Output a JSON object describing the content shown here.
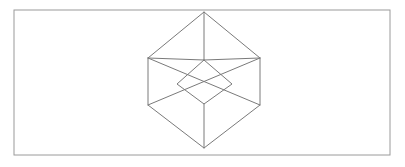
{
  "page": {
    "background_color": "#ffffff",
    "width": 405,
    "height": 167
  },
  "frame": {
    "name": "figure-border",
    "x": 14,
    "y": 10,
    "width": 376,
    "height": 145,
    "stroke_color": "#9a9a9a",
    "stroke_width": 1,
    "fill_color": "#ffffff"
  },
  "figure": {
    "kind": "wireframe-cube",
    "stroke_color": "#7a7a7a",
    "stroke_width": 1,
    "center_x": 204,
    "center_y": 80,
    "outline_points": "204,12 260,58 260,105 204,148 148,105 148,58",
    "outline_vertices": [
      {
        "name": "top",
        "x": 204,
        "y": 12
      },
      {
        "name": "upper-right",
        "x": 260,
        "y": 58
      },
      {
        "name": "lower-right",
        "x": 260,
        "y": 105
      },
      {
        "name": "bottom",
        "x": 204,
        "y": 148
      },
      {
        "name": "lower-left",
        "x": 148,
        "y": 105
      },
      {
        "name": "upper-left",
        "x": 148,
        "y": 58
      }
    ],
    "inner_vertices": [
      {
        "name": "inner-top",
        "x": 204,
        "y": 60
      },
      {
        "name": "inner-right",
        "x": 232,
        "y": 84
      },
      {
        "name": "inner-bottom",
        "x": 204,
        "y": 104
      },
      {
        "name": "inner-left",
        "x": 177,
        "y": 84
      }
    ],
    "inner_rhombus_points": "204,60 232,84 204,104 177,84",
    "internal_edges": [
      {
        "name": "spoke-top-vertical",
        "x1": 204,
        "y1": 12,
        "x2": 204,
        "y2": 60
      },
      {
        "name": "spoke-center-to-upper-left",
        "x1": 204,
        "y1": 60,
        "x2": 148,
        "y2": 58
      },
      {
        "name": "spoke-center-to-upper-right",
        "x1": 204,
        "y1": 60,
        "x2": 260,
        "y2": 58
      },
      {
        "name": "diagonal-upper-left-to-inner-right",
        "x1": 148,
        "y1": 58,
        "x2": 260,
        "y2": 105
      },
      {
        "name": "diagonal-upper-right-to-inner-left",
        "x1": 260,
        "y1": 58,
        "x2": 148,
        "y2": 105
      },
      {
        "name": "spoke-bottom-vertical",
        "x1": 204,
        "y1": 104,
        "x2": 204,
        "y2": 148
      }
    ]
  }
}
